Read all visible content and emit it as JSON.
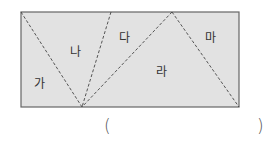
{
  "diagram": {
    "fill_color": "#e2e2e2",
    "border_color": "#666666",
    "dash_color": "#444444",
    "rectangle": {
      "x": 21,
      "y": 12,
      "width": 218,
      "height": 95
    },
    "regions": [
      {
        "label": "가",
        "x": 39,
        "y": 88
      },
      {
        "label": "나",
        "x": 75,
        "y": 56
      },
      {
        "label": "다",
        "x": 124,
        "y": 42
      },
      {
        "label": "라",
        "x": 161,
        "y": 76
      },
      {
        "label": "마",
        "x": 210,
        "y": 42
      }
    ]
  },
  "answer": {
    "open_paren": "(",
    "close_paren": ")"
  }
}
